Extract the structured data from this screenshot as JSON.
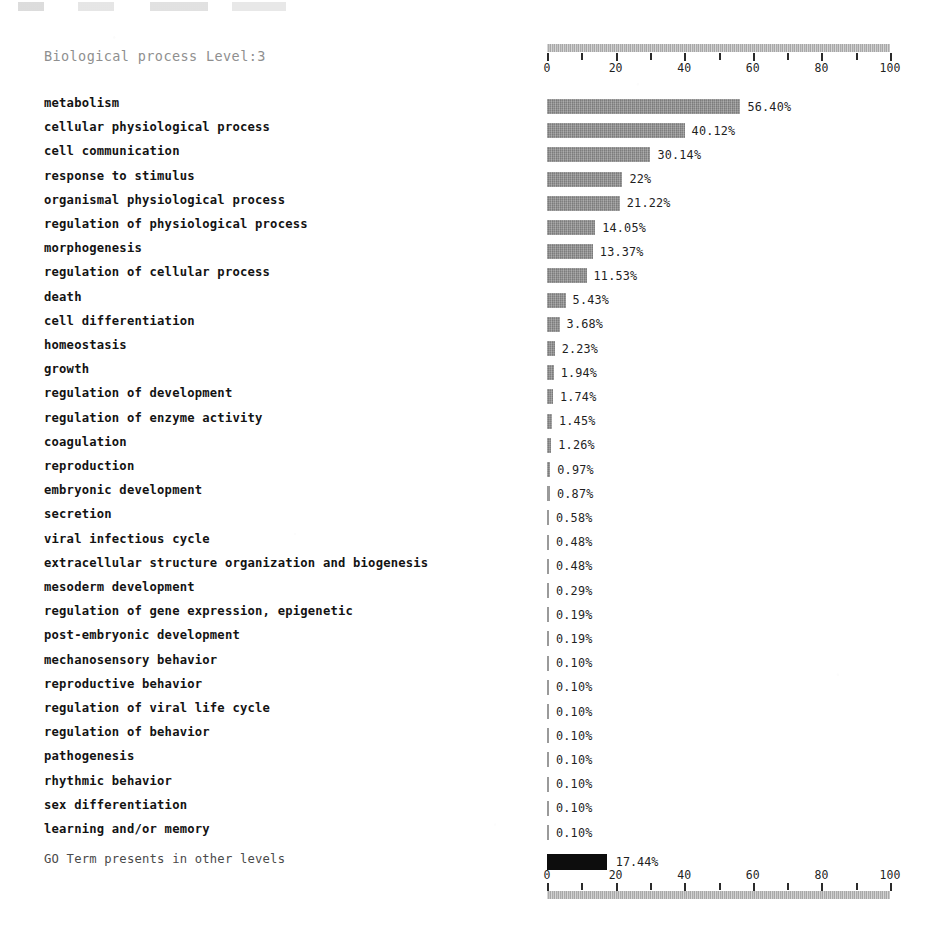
{
  "chart_data": {
    "type": "bar",
    "title": "Biological process Level:3",
    "orientation": "horizontal",
    "xlabel": "",
    "ylabel": "",
    "xlim": [
      0,
      100
    ],
    "x_unit": "%",
    "grid": false,
    "legend": "none",
    "axis_ticks": [
      0,
      10,
      20,
      30,
      40,
      50,
      60,
      70,
      80,
      90,
      100
    ],
    "axis_tick_labels": [
      "0",
      "20",
      "40",
      "60",
      "80",
      "100"
    ],
    "axis_labeled_values": [
      0,
      20,
      40,
      60,
      80,
      100
    ],
    "bar_color": "#8b8b8b",
    "axis_bar_color": "#b4b4b4",
    "other_levels_bar_color": "#0d0d0d",
    "categories": [
      "metabolism",
      "cellular physiological process",
      "cell communication",
      "response to stimulus",
      "organismal physiological process",
      "regulation of physiological process",
      "morphogenesis",
      "regulation of cellular process",
      "death",
      "cell differentiation",
      "homeostasis",
      "growth",
      "regulation of development",
      "regulation of enzyme activity",
      "coagulation",
      "reproduction",
      "embryonic development",
      "secretion",
      "viral infectious cycle",
      "extracellular structure organization and biogenesis",
      "mesoderm development",
      "regulation of gene expression, epigenetic",
      "post-embryonic development",
      "mechanosensory behavior",
      "reproductive behavior",
      "regulation of viral life cycle",
      "regulation of behavior",
      "pathogenesis",
      "rhythmic behavior",
      "sex differentiation",
      "learning and/or memory"
    ],
    "values": [
      56.4,
      40.12,
      30.14,
      22,
      21.22,
      14.05,
      13.37,
      11.53,
      5.43,
      3.68,
      2.23,
      1.94,
      1.74,
      1.45,
      1.26,
      0.97,
      0.87,
      0.58,
      0.48,
      0.48,
      0.29,
      0.19,
      0.19,
      0.1,
      0.1,
      0.1,
      0.1,
      0.1,
      0.1,
      0.1,
      0.1
    ],
    "value_labels": [
      "56.40%",
      "40.12%",
      "30.14%",
      "22%",
      "21.22%",
      "14.05%",
      "13.37%",
      "11.53%",
      "5.43%",
      "3.68%",
      "2.23%",
      "1.94%",
      "1.74%",
      "1.45%",
      "1.26%",
      "0.97%",
      "0.87%",
      "0.58%",
      "0.48%",
      "0.48%",
      "0.29%",
      "0.19%",
      "0.19%",
      "0.10%",
      "0.10%",
      "0.10%",
      "0.10%",
      "0.10%",
      "0.10%",
      "0.10%",
      "0.10%"
    ]
  },
  "footer": {
    "label": "GO Term presents in other levels",
    "value": 17.44,
    "value_label": "17.44%"
  }
}
